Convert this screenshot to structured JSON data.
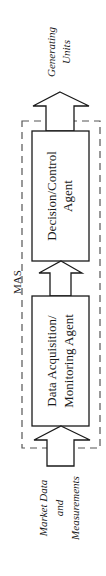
{
  "diagram": {
    "container_label": "MAS",
    "agents": [
      {
        "id": "decision",
        "lines": [
          "Decision/Control",
          "Agent"
        ]
      },
      {
        "id": "data",
        "lines": [
          "Data Acquisition/",
          "Monitoring Agent"
        ]
      }
    ],
    "output": {
      "lines": [
        "Generating",
        "Units"
      ]
    },
    "input": {
      "lines": [
        "Market Data",
        "and",
        "Measurements"
      ]
    },
    "colors": {
      "stroke": "#1a1a1a",
      "dash": "#555555",
      "background": "#ffffff"
    }
  }
}
